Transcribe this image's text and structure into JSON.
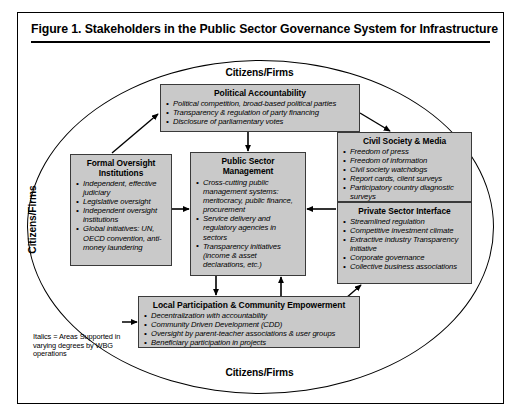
{
  "figure": {
    "title": "Figure 1.  Stakeholders in the Public Sector Governance System for Infrastructure"
  },
  "ring_labels": {
    "top": "Citizens/Firms",
    "bottom": "Citizens/Firms",
    "left": "Citizens/Firms",
    "right": "Citizens/Firms"
  },
  "boxes": {
    "political_accountability": {
      "title": "Political Accountability",
      "items": [
        "Political competition, broad-based political parties",
        "Transparency & regulation of party financing",
        "Disclosure of parliamentary votes"
      ]
    },
    "formal_oversight": {
      "title": "Formal Oversight Institutions",
      "items": [
        "Independent, effective judiciary",
        "Legislative oversight",
        "Independent oversight institutions",
        "Global initiatives: UN, OECD convention, anti-money laundering"
      ]
    },
    "public_sector_management": {
      "title": "Public Sector Management",
      "items": [
        "Cross-cutting public management systems: meritocracy, public finance, procurement",
        "Service delivery and regulatory agencies in sectors",
        "Transparency initiatives (income & asset declarations, etc.)"
      ]
    },
    "civil_society_media": {
      "title": "Civil Society & Media",
      "items": [
        "Freedom of press",
        "Freedom of information",
        "Civil society watchdogs",
        "Report cards, client surveys",
        "Participatory country diagnostic surveys"
      ]
    },
    "private_sector_interface": {
      "title": "Private Sector Interface",
      "items": [
        "Streamlined regulation",
        "Competitive investment climate",
        "Extractive industry Transparency initiative",
        "Corporate governance",
        "Collective business associations"
      ]
    },
    "local_participation": {
      "title": "Local Participation & Community Empowerment",
      "items": [
        "Decentralization with accountability",
        "Community Driven Development (CDD)",
        "Oversight by parent-teacher associations & user groups",
        "Beneficiary participation in projects"
      ]
    }
  },
  "legend": {
    "note": "Italics = Areas Supported in varying degrees by WBG operations"
  },
  "colors": {
    "box_fill": "#c9c9c9",
    "box_border": "#3a3a3a",
    "line": "#000000",
    "background": "#ffffff"
  }
}
